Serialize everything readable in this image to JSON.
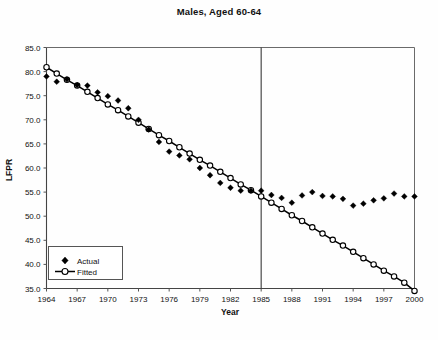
{
  "chart_data": {
    "type": "scatter",
    "title": "Males, Aged 60-64",
    "xlabel": "Year",
    "ylabel": "LFPR",
    "xlim": [
      1964,
      2000
    ],
    "ylim": [
      35.0,
      85.0
    ],
    "grid": false,
    "legend_position": "bottom-left",
    "x_ticks": [
      "1964",
      "1967",
      "1970",
      "1973",
      "1976",
      "1979",
      "1982",
      "1985",
      "1988",
      "1991",
      "1994",
      "1997",
      "2000"
    ],
    "x_tick_values": [
      1964,
      1967,
      1970,
      1973,
      1976,
      1979,
      1982,
      1985,
      1988,
      1991,
      1994,
      1997,
      2000
    ],
    "y_ticks": [
      "35.0",
      "40.0",
      "45.0",
      "50.0",
      "55.0",
      "60.0",
      "65.0",
      "70.0",
      "75.0",
      "80.0",
      "85.0"
    ],
    "y_tick_values": [
      35.0,
      40.0,
      45.0,
      50.0,
      55.0,
      60.0,
      65.0,
      70.0,
      75.0,
      80.0,
      85.0
    ],
    "annotations": [
      {
        "name": "break-line",
        "type": "vline",
        "x": 1985,
        "label": ""
      }
    ],
    "x": [
      1964,
      1965,
      1966,
      1967,
      1968,
      1969,
      1970,
      1971,
      1972,
      1973,
      1974,
      1975,
      1976,
      1977,
      1978,
      1979,
      1980,
      1981,
      1982,
      1983,
      1984,
      1985,
      1986,
      1987,
      1988,
      1989,
      1990,
      1991,
      1992,
      1993,
      1994,
      1995,
      1996,
      1997,
      1998,
      1999,
      2000
    ],
    "series": [
      {
        "name": "Actual",
        "marker": "filled-diamond",
        "values": [
          79.0,
          77.9,
          78.4,
          77.2,
          77.1,
          75.7,
          74.9,
          74.0,
          72.4,
          70.0,
          68.0,
          65.4,
          63.4,
          62.6,
          61.8,
          60.0,
          58.5,
          56.9,
          55.9,
          55.3,
          55.3,
          55.3,
          54.4,
          53.8,
          52.8,
          54.3,
          55.0,
          54.2,
          54.1,
          53.6,
          52.2,
          52.6,
          53.3,
          53.7,
          54.7,
          54.1,
          54.1
        ]
      },
      {
        "name": "Fitted",
        "marker": "open-circle-line",
        "values": [
          80.9,
          79.6,
          78.3,
          77.1,
          75.8,
          74.5,
          73.2,
          72.0,
          70.7,
          69.4,
          68.1,
          66.8,
          65.6,
          64.3,
          63.0,
          61.7,
          60.5,
          59.2,
          57.9,
          56.6,
          55.4,
          54.1,
          52.8,
          51.5,
          50.2,
          49.0,
          47.7,
          46.4,
          45.1,
          43.9,
          42.6,
          41.3,
          40.0,
          38.7,
          37.5,
          36.2,
          34.5
        ]
      }
    ]
  },
  "legend": {
    "entries": [
      {
        "label": "Actual",
        "marker": "filled-diamond"
      },
      {
        "label": "Fitted",
        "marker": "open-circle-line"
      }
    ]
  },
  "colors": {
    "background": "#fefefe",
    "ink": "#000000",
    "frame": "#6a6a6a",
    "axis": "#444444",
    "marker_fill_actual": "#000000",
    "marker_fill_fitted": "#ffffff"
  }
}
